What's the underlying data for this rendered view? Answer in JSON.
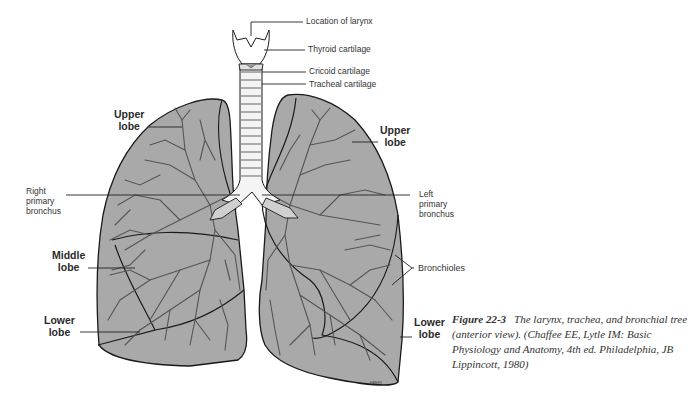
{
  "figure": {
    "number_label": "Figure 22-3",
    "caption_text": "The larynx, trachea, and bronchial tree (anterior view). (Chaffee EE, Lytle IM: Basic Physiology and Anatomy, 4th ed. Philadelphia, JB Lippincott, 1980)"
  },
  "colors": {
    "lung_fill": "#a9a9a9",
    "outline": "#1a1a1a",
    "branch": "#555555",
    "trachea_fill": "#f4f4f4"
  },
  "labels": {
    "larynx": "Location of larynx",
    "thyroid": "Thyroid cartilage",
    "cricoid": "Cricoid cartilage",
    "tracheal": "Tracheal cartilage",
    "right_upper_lobe": [
      "Upper",
      "lobe"
    ],
    "left_upper_lobe": [
      "Upper",
      "lobe"
    ],
    "right_primary_bronchus": [
      "Right",
      "primary",
      "bronchus"
    ],
    "left_primary_bronchus": [
      "Left",
      "primary",
      "bronchus"
    ],
    "middle_lobe": [
      "Middle",
      "lobe"
    ],
    "right_lower_lobe": [
      "Lower",
      "lobe"
    ],
    "left_lower_lobe": [
      "Lower",
      "lobe"
    ],
    "bronchioles": "Bronchioles"
  }
}
